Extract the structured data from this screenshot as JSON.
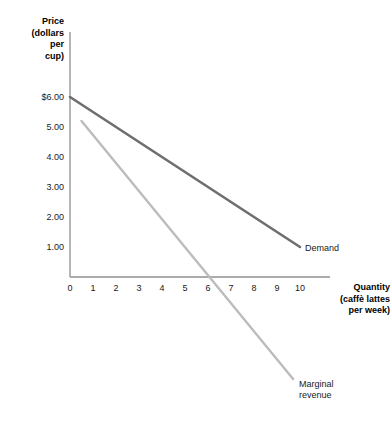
{
  "chart_data": {
    "type": "line",
    "title": "",
    "xlabel": "Quantity (caffè lattes per week)",
    "ylabel": "Price (dollars per cup)",
    "xlim": [
      0,
      10.6
    ],
    "ylim": [
      -4.0,
      6.6
    ],
    "grid": false,
    "legend_position": "inline-end-labels",
    "x_ticks": [
      "0",
      "1",
      "2",
      "3",
      "4",
      "5",
      "6",
      "7",
      "8",
      "9",
      "10"
    ],
    "x_tick_values": [
      0,
      1,
      2,
      3,
      4,
      5,
      6,
      7,
      8,
      9,
      10
    ],
    "y_ticks": [
      "$6.00",
      "5.00",
      "4.00",
      "3.00",
      "2.00",
      "1.00"
    ],
    "y_tick_values": [
      6,
      5,
      4,
      3,
      2,
      1
    ],
    "series": [
      {
        "name": "Demand",
        "color": "#6e6e6e",
        "width": 2.6,
        "x": [
          0,
          10
        ],
        "values": [
          6.0,
          1.0
        ],
        "label": "Demand"
      },
      {
        "name": "Marginal revenue",
        "color": "#bcbcbc",
        "width": 2.4,
        "x": [
          0.5,
          9.7
        ],
        "values": [
          5.2,
          -3.4
        ],
        "label": "Marginal\nrevenue"
      }
    ],
    "annotations": [
      {
        "text": "Demand",
        "x": 10.2,
        "y": 0.55
      },
      {
        "text": "Marginal\nrevenue",
        "x": 10.0,
        "y": -3.55
      }
    ]
  },
  "axes": {
    "y_title": "Price\n(dollars\nper\ncup)",
    "x_title": "Quantity\n(caffè lattes\nper week)",
    "axis_color": "#8f8f8f"
  },
  "ticks": {
    "y": [
      {
        "label": "$6.00",
        "value": 6
      },
      {
        "label": "5.00",
        "value": 5
      },
      {
        "label": "4.00",
        "value": 4
      },
      {
        "label": "3.00",
        "value": 3
      },
      {
        "label": "2.00",
        "value": 2
      },
      {
        "label": "1.00",
        "value": 1
      }
    ],
    "x": [
      {
        "label": "0",
        "value": 0
      },
      {
        "label": "1",
        "value": 1
      },
      {
        "label": "2",
        "value": 2
      },
      {
        "label": "3",
        "value": 3
      },
      {
        "label": "4",
        "value": 4
      },
      {
        "label": "5",
        "value": 5
      },
      {
        "label": "6",
        "value": 6
      },
      {
        "label": "7",
        "value": 7
      },
      {
        "label": "8",
        "value": 8
      },
      {
        "label": "9",
        "value": 9
      },
      {
        "label": "10",
        "value": 10
      }
    ]
  },
  "labels": {
    "demand": "Demand",
    "marginal_revenue": "Marginal\nrevenue"
  }
}
